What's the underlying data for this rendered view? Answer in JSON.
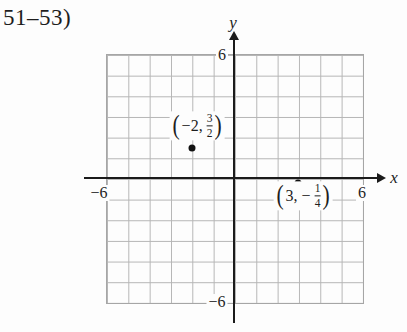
{
  "figure": {
    "exercise_label": "51–53)"
  },
  "axes": {
    "x_label": "x",
    "y_label": "y"
  },
  "ticks": {
    "y_max": "6",
    "y_min": "−6",
    "x_min": "−6",
    "x_max": "6"
  },
  "point_labels": {
    "p1": {
      "open": "(",
      "coords": "−2,",
      "numerator": "3",
      "denominator": "2",
      "close": ")"
    },
    "p2": {
      "open": "(",
      "coords": "3,",
      "sign": "−",
      "numerator": "1",
      "denominator": "4",
      "close": ")"
    }
  },
  "chart_data": {
    "type": "scatter",
    "title": "",
    "xlabel": "x",
    "ylabel": "y",
    "xlim": [
      -6,
      6
    ],
    "ylim": [
      -6,
      6
    ],
    "grid": true,
    "grid_step": 1,
    "visible_tick_labels": {
      "x": [
        "−6",
        "6"
      ],
      "y": [
        "−6",
        "6"
      ]
    },
    "points": [
      {
        "x": -2,
        "y": 1.5,
        "label": "(−2, 3/2)"
      },
      {
        "x": 3,
        "y": -0.25,
        "label": "(3, −1/4)"
      }
    ]
  },
  "colors": {
    "background": "#fdfdfd",
    "grid_line": "#b5b5b5",
    "axis": "#1b1b1b",
    "text": "#1e1e1e"
  }
}
